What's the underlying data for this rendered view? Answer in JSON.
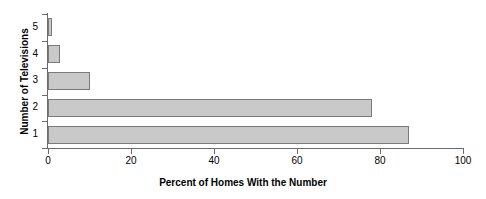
{
  "chart_data": {
    "type": "bar",
    "orientation": "horizontal",
    "title": "",
    "xlabel": "Percent of Homes With the Number",
    "ylabel": "Number of Televisions",
    "categories": [
      "1",
      "2",
      "3",
      "4",
      "5"
    ],
    "values": [
      87,
      78,
      10,
      3,
      1
    ],
    "xlim": [
      0,
      100
    ],
    "xticks": [
      0,
      20,
      40,
      60,
      80,
      100
    ],
    "xtick_labels": [
      "0",
      "20",
      "40",
      "60",
      "80",
      "100"
    ],
    "ytick_labels": [
      "5",
      "4",
      "3",
      "2",
      "1"
    ],
    "grid": false,
    "legend": false,
    "colors": {
      "bar_fill": "#c9c9c9",
      "bar_border": "#7a7a7a",
      "axis": "#6b6b6b",
      "text": "#000000",
      "background": "#ffffff"
    }
  }
}
